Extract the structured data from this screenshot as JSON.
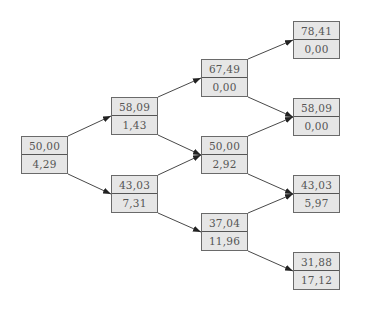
{
  "diagram": {
    "type": "binomial-tree",
    "nodes": [
      {
        "id": "n0",
        "col": 0,
        "value": "50,00",
        "sub": "4,29",
        "x": 21,
        "y": 136
      },
      {
        "id": "n1u",
        "col": 1,
        "value": "58,09",
        "sub": "1,43",
        "x": 111,
        "y": 97
      },
      {
        "id": "n1d",
        "col": 1,
        "value": "43,03",
        "sub": "7,31",
        "x": 111,
        "y": 175
      },
      {
        "id": "n2uu",
        "col": 2,
        "value": "67,49",
        "sub": "0,00",
        "x": 201,
        "y": 59
      },
      {
        "id": "n2ud",
        "col": 2,
        "value": "50,00",
        "sub": "2,92",
        "x": 201,
        "y": 136
      },
      {
        "id": "n2dd",
        "col": 2,
        "value": "37,04",
        "sub": "11,96",
        "x": 201,
        "y": 213
      },
      {
        "id": "n3uuu",
        "col": 3,
        "value": "78,41",
        "sub": "0,00",
        "x": 293,
        "y": 21
      },
      {
        "id": "n3uud",
        "col": 3,
        "value": "58,09",
        "sub": "0,00",
        "x": 293,
        "y": 98
      },
      {
        "id": "n3udd",
        "col": 3,
        "value": "43,03",
        "sub": "5,97",
        "x": 293,
        "y": 175
      },
      {
        "id": "n3ddd",
        "col": 3,
        "value": "31,88",
        "sub": "17,12",
        "x": 293,
        "y": 252
      }
    ],
    "edges": [
      [
        "n0",
        "n1u"
      ],
      [
        "n0",
        "n1d"
      ],
      [
        "n1u",
        "n2uu"
      ],
      [
        "n1u",
        "n2ud"
      ],
      [
        "n1d",
        "n2ud"
      ],
      [
        "n1d",
        "n2dd"
      ],
      [
        "n2uu",
        "n3uuu"
      ],
      [
        "n2uu",
        "n3uud"
      ],
      [
        "n2ud",
        "n3uud"
      ],
      [
        "n2ud",
        "n3udd"
      ],
      [
        "n2dd",
        "n3udd"
      ],
      [
        "n2dd",
        "n3ddd"
      ]
    ],
    "colors": {
      "node_fill": "#e6e6e6",
      "node_border": "#6a6a6a",
      "edge": "#333333",
      "text": "#555555"
    }
  }
}
